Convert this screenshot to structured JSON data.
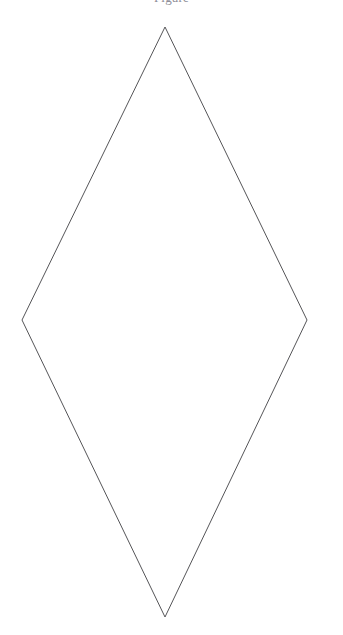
{
  "page": {
    "background_color": "#ffffff",
    "width": 343,
    "height": 635
  },
  "caption": {
    "text": "Figure",
    "color": "#8e8e98",
    "note": "clipped at top edge"
  },
  "figure": {
    "name": "rhombus",
    "fill": "none",
    "stroke_color": "#555558",
    "stroke_width": 1,
    "vertices": {
      "top": {
        "x": 165,
        "y": 27
      },
      "right": {
        "x": 307,
        "y": 320
      },
      "bottom": {
        "x": 165,
        "y": 617
      },
      "left": {
        "x": 22,
        "y": 320
      }
    },
    "points_attr": "165,27 307,320 165,617 22,320",
    "width_px": 285,
    "height_px": 590
  }
}
